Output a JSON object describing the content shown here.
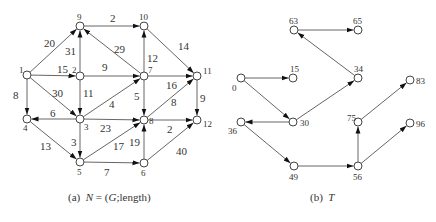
{
  "colors": {
    "line": "#555555",
    "node_stroke": "#444444",
    "text": "#333333",
    "background": "#ffffff"
  },
  "network": {
    "caption_prefix": "(a)",
    "caption_N": "N",
    "caption_eq": " = (",
    "caption_G": "G",
    "caption_rest": ";length)",
    "nodes": [
      {
        "id": "1",
        "x": 27,
        "y": 75,
        "lx": 19,
        "ly": 73
      },
      {
        "id": "2",
        "x": 80,
        "y": 76,
        "lx": 72,
        "ly": 73
      },
      {
        "id": "3",
        "x": 80,
        "y": 119,
        "lx": 84,
        "ly": 130
      },
      {
        "id": "4",
        "x": 27,
        "y": 119,
        "lx": 23,
        "ly": 131
      },
      {
        "id": "5",
        "x": 80,
        "y": 162,
        "lx": 77,
        "ly": 175
      },
      {
        "id": "6",
        "x": 144,
        "y": 163,
        "lx": 141,
        "ly": 176
      },
      {
        "id": "7",
        "x": 144,
        "y": 76,
        "lx": 148,
        "ly": 73
      },
      {
        "id": "8",
        "x": 144,
        "y": 120,
        "lx": 149,
        "ly": 124
      },
      {
        "id": "9",
        "x": 80,
        "y": 26,
        "lx": 77,
        "ly": 20
      },
      {
        "id": "10",
        "x": 144,
        "y": 26,
        "lx": 139,
        "ly": 20
      },
      {
        "id": "11",
        "x": 197,
        "y": 76,
        "lx": 203,
        "ly": 74
      },
      {
        "id": "12",
        "x": 197,
        "y": 120,
        "lx": 203,
        "ly": 127
      }
    ],
    "edges": [
      {
        "from": "1",
        "to": "9",
        "w": "20",
        "wx": 44,
        "wy": 47
      },
      {
        "from": "1",
        "to": "2",
        "w": "15",
        "wx": 57,
        "wy": 73
      },
      {
        "from": "1",
        "to": "3",
        "w": "30",
        "wx": 52,
        "wy": 97
      },
      {
        "from": "1",
        "to": "4",
        "w": "8",
        "wx": 13,
        "wy": 99
      },
      {
        "from": "2",
        "to": "9",
        "w": "31",
        "wx": 65,
        "wy": 55
      },
      {
        "from": "2",
        "to": "7",
        "w": "9",
        "wx": 102,
        "wy": 71
      },
      {
        "from": "2",
        "to": "3",
        "w": "11",
        "wx": 83,
        "wy": 97
      },
      {
        "from": "9",
        "to": "10",
        "w": "2",
        "wx": 110,
        "wy": 22
      },
      {
        "from": "7",
        "to": "9",
        "w": "29",
        "wx": 114,
        "wy": 53
      },
      {
        "from": "7",
        "to": "10",
        "w": "12",
        "wx": 147,
        "wy": 62
      },
      {
        "from": "10",
        "to": "11",
        "w": "14",
        "wx": 178,
        "wy": 50
      },
      {
        "from": "7",
        "to": "11",
        "w": "16",
        "wx": 166,
        "wy": 89
      },
      {
        "from": "7",
        "to": "8",
        "w": "5",
        "wx": 134,
        "wy": 100
      },
      {
        "from": "3",
        "to": "7",
        "w": "4",
        "wx": 109,
        "wy": 108
      },
      {
        "from": "3",
        "to": "4",
        "w": "6",
        "wx": 50,
        "wy": 117
      },
      {
        "from": "3",
        "to": "8",
        "w": "23",
        "wx": 100,
        "wy": 132
      },
      {
        "from": "8",
        "to": "11",
        "w": "8",
        "wx": 171,
        "wy": 106
      },
      {
        "from": "11",
        "to": "12",
        "w": "9",
        "wx": 200,
        "wy": 102
      },
      {
        "from": "8",
        "to": "12",
        "w": "2",
        "wx": 167,
        "wy": 133
      },
      {
        "from": "3",
        "to": "5",
        "w": "3",
        "wx": 71,
        "wy": 146
      },
      {
        "from": "4",
        "to": "5",
        "w": "13",
        "wx": 40,
        "wy": 150
      },
      {
        "from": "5",
        "to": "8",
        "w": "17",
        "wx": 113,
        "wy": 150
      },
      {
        "from": "6",
        "to": "8",
        "w": "19",
        "wx": 129,
        "wy": 146
      },
      {
        "from": "5",
        "to": "6",
        "w": "7",
        "wx": 104,
        "wy": 176
      },
      {
        "from": "6",
        "to": "12",
        "w": "40",
        "wx": 176,
        "wy": 155
      }
    ]
  },
  "tree": {
    "caption_prefix": "(b)",
    "caption_T": "T",
    "nodes": [
      {
        "id": "0",
        "x": 241,
        "y": 78,
        "lx": 232,
        "ly": 91
      },
      {
        "id": "15",
        "x": 293,
        "y": 78,
        "lx": 290,
        "ly": 72
      },
      {
        "id": "30",
        "x": 293,
        "y": 122,
        "lx": 300,
        "ly": 126
      },
      {
        "id": "36",
        "x": 241,
        "y": 122,
        "lx": 228,
        "ly": 134
      },
      {
        "id": "34",
        "x": 358,
        "y": 78,
        "lx": 354,
        "ly": 72
      },
      {
        "id": "63",
        "x": 294,
        "y": 30,
        "lx": 289,
        "ly": 24
      },
      {
        "id": "65",
        "x": 358,
        "y": 30,
        "lx": 353,
        "ly": 24
      },
      {
        "id": "49",
        "x": 294,
        "y": 166,
        "lx": 289,
        "ly": 180
      },
      {
        "id": "56",
        "x": 358,
        "y": 166,
        "lx": 353,
        "ly": 180
      },
      {
        "id": "75",
        "x": 358,
        "y": 122,
        "lx": 347,
        "ly": 121
      },
      {
        "id": "83",
        "x": 410,
        "y": 80,
        "lx": 416,
        "ly": 84
      },
      {
        "id": "96",
        "x": 410,
        "y": 123,
        "lx": 416,
        "ly": 127
      }
    ],
    "edges": [
      {
        "from": "0",
        "to": "15"
      },
      {
        "from": "0",
        "to": "30"
      },
      {
        "from": "30",
        "to": "36"
      },
      {
        "from": "30",
        "to": "34"
      },
      {
        "from": "34",
        "to": "63"
      },
      {
        "from": "63",
        "to": "65"
      },
      {
        "from": "36",
        "to": "49"
      },
      {
        "from": "49",
        "to": "56"
      },
      {
        "from": "56",
        "to": "75"
      },
      {
        "from": "56",
        "to": "96"
      },
      {
        "from": "75",
        "to": "83"
      }
    ]
  }
}
